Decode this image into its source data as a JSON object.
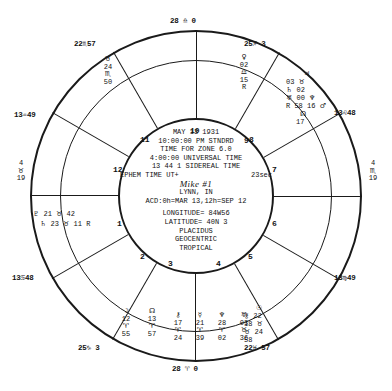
{
  "chart_meta": {
    "type": "astrological-natal-wheel",
    "title": "Natal Chart Wheel"
  },
  "center": {
    "date": "MAY 13 1931",
    "time_local": "10:00:00 PM STNDRD",
    "zone": "TIME FOR ZONE  6.0",
    "time_universal": "4:00:00 UNIVERSAL TIME",
    "sidereal": "13 44  1 SIDEREAL TIME",
    "ephem": "EPHEM TIME UT+",
    "ephem_sec": "23sec",
    "handwriting": "Mike #1",
    "place": "LYNN, IN",
    "acd": "ACD:0h=MAR 13,12h=SEP 12",
    "longitude": "LONGITUDE= 84W56",
    "latitude": "LATITUDE= 40N 3",
    "house_system": "PLACIDUS",
    "frame": "GEOCENTRIC",
    "zodiac": "TROPICAL"
  },
  "cusps": [
    {
      "id": "cusp-10-mc",
      "text": "28 ♎ 0"
    },
    {
      "id": "cusp-11",
      "text": "22♏57"
    },
    {
      "id": "cusp-12",
      "text": "25♐ 3"
    },
    {
      "id": "cusp-1-asc",
      "text": "13♌48"
    },
    {
      "id": "cusp-9",
      "text": "13♒49"
    },
    {
      "id": "cusp-2",
      "text": "13♍49"
    },
    {
      "id": "cusp-8",
      "text": "13♋48"
    },
    {
      "id": "cusp-4-ic",
      "text": "28 ♈ 0"
    },
    {
      "id": "cusp-5",
      "text": "22♓ 57"
    },
    {
      "id": "cusp-6",
      "text": "25♑ 3"
    }
  ],
  "house_numbers": [
    {
      "id": "house-11",
      "label": "11"
    },
    {
      "id": "house-10",
      "label": "10"
    },
    {
      "id": "house-9",
      "label": "9"
    },
    {
      "id": "house-8",
      "label": "8"
    },
    {
      "id": "house-12",
      "label": "12"
    },
    {
      "id": "house-7",
      "label": "7"
    },
    {
      "id": "house-1",
      "label": "1"
    },
    {
      "id": "house-6",
      "label": "6"
    },
    {
      "id": "house-2",
      "label": "2"
    },
    {
      "id": "house-5",
      "label": "5"
    },
    {
      "id": "house-3",
      "label": "3"
    },
    {
      "id": "house-4",
      "label": "4"
    }
  ],
  "planets": {
    "upper_left_stack": {
      "glyph": "♉",
      "deg": "24",
      "sign": "♏",
      "min": "50"
    },
    "upper_right_stack": {
      "glyph": "♀",
      "deg": "02",
      "sign": "♎",
      "min": "15",
      "retro": "R"
    },
    "right_cluster": {
      "line1_glyph": "♃",
      "line1_deg": "03",
      "line1_sign": "♉",
      "line2_glyph": "♄",
      "line2_deg": "02",
      "line3_glyph": "♅",
      "line3_deg": "00",
      "line3_retro": "R",
      "line4_glyph": "♆",
      "line4_min": "58",
      "line4_extra": "16",
      "line5_glyph": "♂",
      "node_glyph": "☊",
      "node_deg": "17"
    },
    "left_rows": [
      {
        "glyph": "♇",
        "deg": "21",
        "sign": "♉",
        "min": "42"
      },
      {
        "glyph": "♄",
        "deg": "23",
        "sign": "♉",
        "min": "11",
        "retro": "R"
      }
    ],
    "left_side_stack": {
      "deg": "4",
      "sign": "♉",
      "min": "19"
    },
    "right_side_stack": {
      "deg": "4",
      "sign": "♏",
      "min": "19"
    },
    "bottom_row": [
      {
        "glyph": "☽",
        "deg": "12",
        "sign": "♈",
        "min": "55"
      },
      {
        "glyph": "☊",
        "deg": "13",
        "sign": "♈",
        "min": "57"
      },
      {
        "glyph": "⚷",
        "deg": "17",
        "sign": "♈",
        "min": "24"
      },
      {
        "glyph": "☿",
        "deg": "21",
        "sign": "♈",
        "min": "39"
      },
      {
        "glyph": "♆",
        "deg": "28",
        "sign": "♈",
        "min": "02"
      },
      {
        "glyph": "♅",
        "deg": "03",
        "sign": "♉",
        "min": "36"
      }
    ],
    "bottom_right_stack": {
      "sun_glyph": "☉",
      "sun_deg": "22",
      "chiron_glyph": "⚷",
      "chiron_deg": "18",
      "chiron_sign": "♉",
      "last_sign": "♉",
      "last_deg": "24",
      "last_min": "58"
    }
  }
}
